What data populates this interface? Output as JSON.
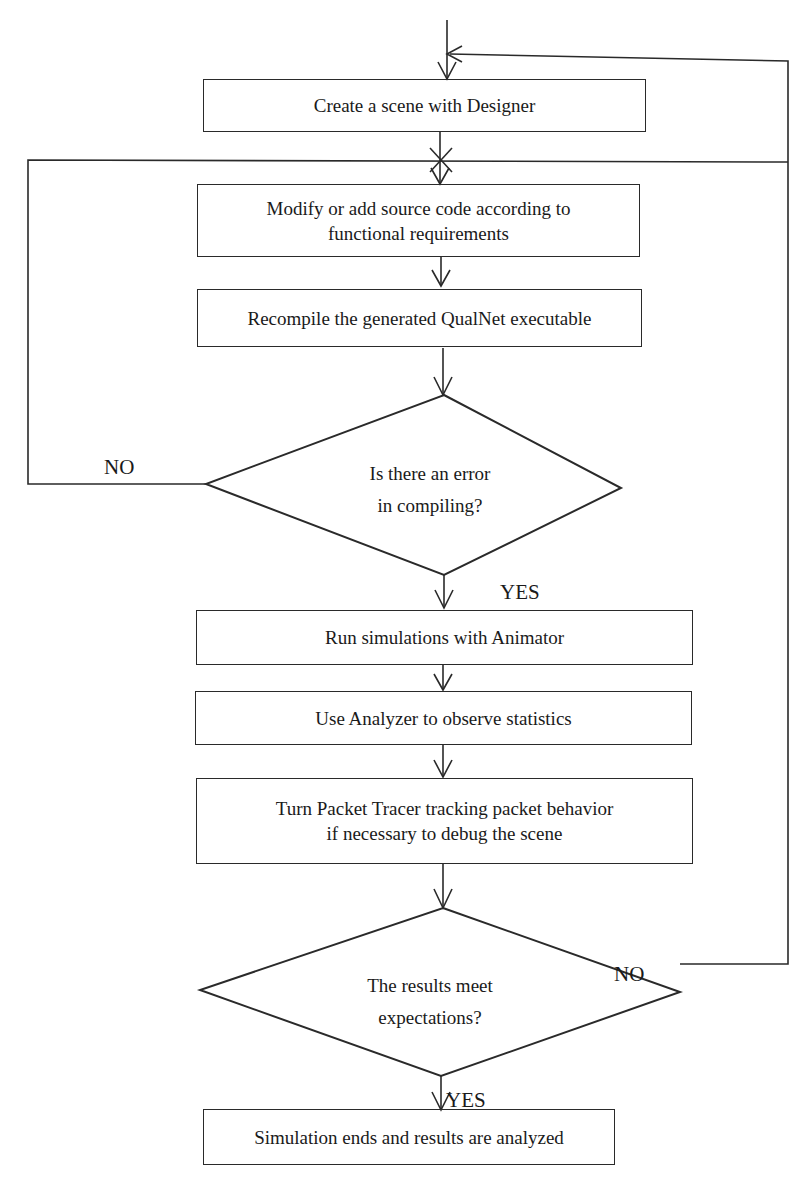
{
  "diagram": {
    "type": "flowchart",
    "steps": [
      {
        "id": "create",
        "lines": [
          "Create a scene with Designer"
        ]
      },
      {
        "id": "modify",
        "lines": [
          "Modify or add source code according to",
          "functional requirements"
        ]
      },
      {
        "id": "recompile",
        "lines": [
          "Recompile the generated QualNet executable"
        ]
      },
      {
        "id": "run",
        "lines": [
          "Run simulations with Animator"
        ]
      },
      {
        "id": "analyze",
        "lines": [
          "Use Analyzer to observe statistics"
        ]
      },
      {
        "id": "trace",
        "lines": [
          "Turn Packet Tracer tracking packet behavior",
          "if necessary to debug the scene"
        ]
      },
      {
        "id": "end",
        "lines": [
          "Simulation ends and results are analyzed"
        ]
      }
    ],
    "decisions": [
      {
        "id": "compile_error",
        "lines": [
          "Is there an error",
          "in compiling?"
        ],
        "no_label": "NO",
        "yes_label": "YES"
      },
      {
        "id": "results_ok",
        "lines": [
          "The results meet",
          "expectations?"
        ],
        "no_label": "NO",
        "yes_label": "YES"
      }
    ],
    "colors": {
      "stroke": "#2a2a2a",
      "background": "#ffffff"
    }
  }
}
